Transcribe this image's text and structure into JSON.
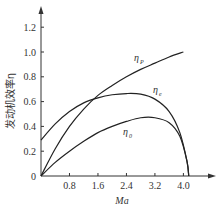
{
  "chart_data": {
    "type": "line",
    "title": "",
    "xlabel": "Ma",
    "ylabel": "发动机效率η",
    "xlim": [
      0,
      4.4
    ],
    "ylim": [
      0,
      1.3
    ],
    "xticks": [
      "0.8",
      "1.6",
      "2.4",
      "3.2",
      "4.0"
    ],
    "yticks": [
      "0",
      "0.2",
      "0.4",
      "0.6",
      "0.8",
      "1.0",
      "1.2"
    ],
    "origin_label": "0",
    "grid": false,
    "legend": "inline labels",
    "series": [
      {
        "name": "η_P",
        "label_main": "η",
        "label_sub": "P",
        "x": [
          0,
          0.4,
          0.8,
          1.2,
          1.6,
          2.0,
          2.4,
          2.8,
          3.2,
          3.6,
          4.0
        ],
        "y": [
          0,
          0.22,
          0.4,
          0.54,
          0.65,
          0.73,
          0.8,
          0.86,
          0.91,
          0.96,
          1.0
        ]
      },
      {
        "name": "η_e",
        "label_main": "η",
        "label_sub": "e",
        "x": [
          0,
          0.4,
          0.8,
          1.2,
          1.6,
          2.0,
          2.4,
          2.8,
          3.2,
          3.6,
          3.9,
          4.1,
          4.15
        ],
        "y": [
          0.29,
          0.42,
          0.52,
          0.59,
          0.63,
          0.655,
          0.665,
          0.66,
          0.62,
          0.52,
          0.35,
          0.12,
          0
        ]
      },
      {
        "name": "η_0",
        "label_main": "η",
        "label_sub": "0",
        "x": [
          0,
          0.4,
          0.8,
          1.2,
          1.6,
          2.0,
          2.4,
          2.8,
          3.2,
          3.6,
          3.9,
          4.1,
          4.15
        ],
        "y": [
          0,
          0.11,
          0.2,
          0.28,
          0.35,
          0.4,
          0.44,
          0.47,
          0.47,
          0.43,
          0.32,
          0.12,
          0
        ]
      }
    ]
  }
}
